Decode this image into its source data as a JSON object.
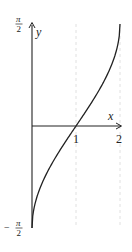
{
  "chart_data": {
    "type": "line",
    "title": "",
    "function": "y = arcsin(x - 1)",
    "xlabel": "x",
    "ylabel": "y",
    "xlim": [
      0,
      2
    ],
    "ylim": [
      -1.5708,
      1.5708
    ],
    "x_ticks": [
      {
        "value": 1,
        "label": "1"
      },
      {
        "value": 2,
        "label": "2"
      }
    ],
    "y_ticks": [
      {
        "value": 1.5708,
        "label_num": "π",
        "label_den": "2",
        "sign": ""
      },
      {
        "value": -1.5708,
        "label_num": "π",
        "label_den": "2",
        "sign": "−"
      }
    ],
    "grid": "dashed vertical guides at x=1 and x=2",
    "series": [
      {
        "name": "arcsin(x-1)",
        "x": [
          0,
          0.02,
          0.1,
          0.2,
          0.4,
          0.6,
          0.8,
          1.0,
          1.2,
          1.4,
          1.6,
          1.8,
          1.9,
          1.98,
          2.0
        ],
        "values": [
          -1.5708,
          -1.3705,
          -1.1198,
          -0.9273,
          -0.6435,
          -0.4115,
          -0.2014,
          0,
          0.2014,
          0.4115,
          0.6435,
          0.9273,
          1.1198,
          1.3705,
          1.5708
        ]
      }
    ],
    "colors": {
      "axis": "#222222",
      "curve": "#222222",
      "guide": "#d8d8d8"
    }
  }
}
